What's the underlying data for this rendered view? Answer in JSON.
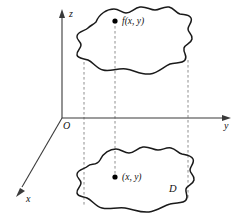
{
  "figure": {
    "background_color": "#ffffff",
    "axis_color": "#3a3a3a",
    "curve_color": "#1a1a1a",
    "dashed_color": "#8e8e8e",
    "dot_color": "#000000"
  },
  "axes": {
    "z_label": "z",
    "y_label": "y",
    "x_label": "x",
    "origin_label": "O"
  },
  "labels": {
    "surface_point": "f(x, y)",
    "domain_point": "(x, y)",
    "domain_region": "D"
  },
  "geometry": {
    "upper_blob_desc": "irregular closed curve (surface patch)",
    "lower_blob_desc": "irregular closed curve (region D)",
    "dashed_projections": 3
  }
}
